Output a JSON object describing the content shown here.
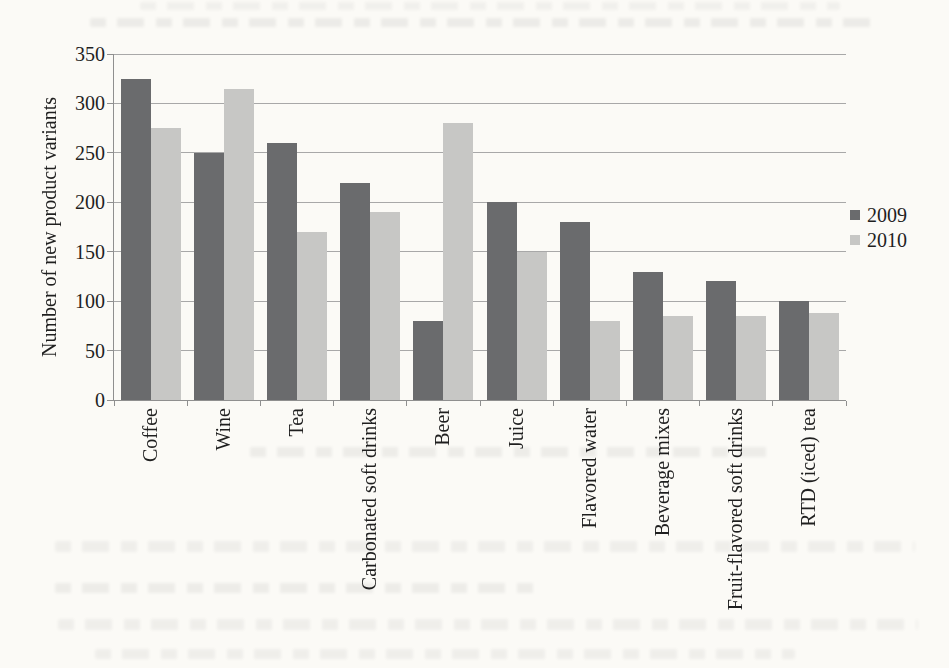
{
  "page": {
    "kind": "scanned book figure",
    "background_color": "#fbfaf6",
    "text_color": "#1f1f1f",
    "axis_color": "#8f8f8f",
    "gridline_color": "#a8a8a8"
  },
  "chart_data": {
    "type": "bar",
    "title": "",
    "xlabel": "",
    "ylabel": "Number of new product variants",
    "ylim": [
      0,
      350
    ],
    "yticks": [
      0,
      50,
      100,
      150,
      200,
      250,
      300,
      350
    ],
    "grid": true,
    "legend_position": "right",
    "categories": [
      "Coffee",
      "Wine",
      "Tea",
      "Carbonated soft drinks",
      "Beer",
      "Juice",
      "Flavored water",
      "Beverage mixes",
      "Fruit-flavored soft drinks",
      "RTD (iced) tea"
    ],
    "series": [
      {
        "name": "2009",
        "color": "#6a6b6d",
        "values": [
          325,
          250,
          260,
          220,
          80,
          200,
          180,
          130,
          120,
          100
        ]
      },
      {
        "name": "2010",
        "color": "#c7c7c5",
        "values": [
          275,
          315,
          170,
          190,
          280,
          150,
          80,
          85,
          85,
          88
        ]
      }
    ]
  }
}
